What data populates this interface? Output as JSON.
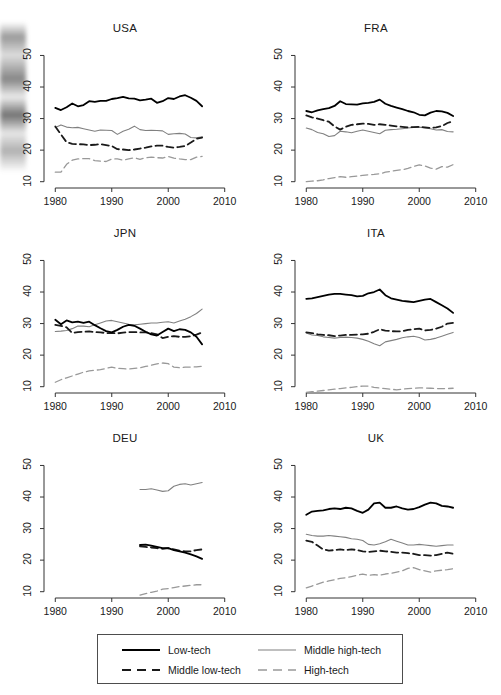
{
  "figure": {
    "background_color": "#ffffff",
    "panel_titles": [
      "USA",
      "FRA",
      "JPN",
      "ITA",
      "DEU",
      "UK"
    ]
  },
  "series_styles": {
    "low_tech": {
      "color": "#000000",
      "dash": "solid",
      "width": 1.8
    },
    "middle_low_tech": {
      "color": "#1a1a1a",
      "dash": "dashed",
      "width": 1.8
    },
    "middle_high_tech": {
      "color": "#808080",
      "dash": "solid",
      "width": 1.1
    },
    "high_tech": {
      "color": "#999999",
      "dash": "dashed",
      "width": 1.3
    }
  },
  "legend": {
    "position": "bottom-center",
    "entries": [
      {
        "label": "Low-tech",
        "key": "low_tech"
      },
      {
        "label": "Middle high-tech",
        "key": "middle_high_tech"
      },
      {
        "label": "Middle low-tech",
        "key": "middle_low_tech"
      },
      {
        "label": "High-tech",
        "key": "high_tech"
      }
    ]
  },
  "axes": {
    "xlim": [
      1978,
      2012
    ],
    "ylim": [
      8,
      53
    ],
    "xticks": [
      1980,
      1990,
      2000,
      2010
    ],
    "yticks": [
      10,
      20,
      30,
      40,
      50
    ],
    "xtick_labels": [
      "1980",
      "1990",
      "2000",
      "2010"
    ],
    "ytick_labels": [
      "10",
      "20",
      "30",
      "40",
      "50"
    ],
    "grid": false,
    "xlabel": "",
    "ylabel": ""
  },
  "chart_data": [
    {
      "type": "line",
      "title": "USA",
      "xlabel": "",
      "ylabel": "",
      "xlim": [
        1978,
        2012
      ],
      "ylim": [
        8,
        53
      ],
      "grid": false,
      "legend_position": "bottom-center",
      "x": [
        1980,
        1981,
        1982,
        1983,
        1984,
        1985,
        1986,
        1987,
        1988,
        1989,
        1990,
        1991,
        1992,
        1993,
        1994,
        1995,
        1996,
        1997,
        1998,
        1999,
        2000,
        2001,
        2002,
        2003,
        2004,
        2005,
        2006
      ],
      "series": [
        {
          "name": "Low-tech",
          "key": "low_tech",
          "values": [
            33.4,
            32.7,
            33.6,
            34.8,
            33.9,
            34.3,
            35.5,
            35.3,
            35.6,
            35.6,
            36.2,
            36.5,
            36.9,
            36.4,
            36.3,
            35.8,
            36.0,
            36.3,
            35.0,
            35.5,
            36.5,
            36.2,
            37.0,
            37.4,
            36.6,
            35.6,
            33.9
          ]
        },
        {
          "name": "Middle low-tech",
          "key": "middle_low_tech",
          "values": [
            27.5,
            25.0,
            22.5,
            22.0,
            21.9,
            21.8,
            21.6,
            21.7,
            21.9,
            21.6,
            21.3,
            20.3,
            20.2,
            20.0,
            20.2,
            20.5,
            20.8,
            21.2,
            21.4,
            21.4,
            21.0,
            20.8,
            21.0,
            21.3,
            22.4,
            23.6,
            24.0
          ]
        },
        {
          "name": "Middle high-tech",
          "key": "middle_high_tech",
          "values": [
            27.2,
            28.0,
            27.3,
            27.1,
            27.2,
            26.8,
            26.4,
            26.0,
            26.4,
            26.3,
            26.2,
            25.0,
            26.0,
            26.6,
            27.6,
            26.5,
            26.2,
            26.3,
            26.2,
            26.1,
            25.0,
            25.2,
            25.3,
            25.1,
            24.0,
            23.9,
            24.2
          ]
        },
        {
          "name": "High-tech",
          "key": "high_tech",
          "values": [
            13.0,
            13.0,
            15.5,
            16.8,
            17.2,
            17.3,
            17.3,
            16.7,
            16.5,
            16.4,
            17.2,
            17.2,
            16.8,
            17.2,
            17.6,
            17.1,
            17.6,
            17.8,
            17.6,
            17.5,
            18.0,
            17.5,
            17.2,
            17.0,
            17.0,
            17.8,
            18.0
          ]
        }
      ]
    },
    {
      "type": "line",
      "title": "FRA",
      "xlabel": "",
      "ylabel": "",
      "xlim": [
        1978,
        2012
      ],
      "ylim": [
        8,
        53
      ],
      "grid": false,
      "legend_position": "bottom-center",
      "x": [
        1980,
        1981,
        1982,
        1983,
        1984,
        1985,
        1986,
        1987,
        1988,
        1989,
        1990,
        1991,
        1992,
        1993,
        1994,
        1995,
        1996,
        1997,
        1998,
        1999,
        2000,
        2001,
        2002,
        2003,
        2004,
        2005,
        2006
      ],
      "series": [
        {
          "name": "Low-tech",
          "key": "low_tech",
          "values": [
            32.4,
            32.0,
            32.6,
            33.0,
            33.3,
            34.0,
            35.5,
            34.6,
            34.5,
            34.4,
            34.8,
            35.0,
            35.3,
            36.0,
            34.7,
            34.0,
            33.5,
            33.0,
            32.4,
            32.0,
            31.2,
            31.0,
            31.9,
            32.4,
            32.3,
            31.8,
            30.8
          ]
        },
        {
          "name": "Middle low-tech",
          "key": "middle_low_tech",
          "values": [
            31.0,
            30.4,
            30.0,
            29.5,
            29.0,
            27.5,
            26.5,
            27.4,
            28.0,
            28.2,
            28.4,
            28.3,
            28.0,
            28.2,
            28.0,
            27.8,
            27.5,
            27.4,
            27.2,
            27.3,
            27.4,
            27.2,
            27.0,
            27.2,
            27.6,
            28.6,
            29.2
          ]
        },
        {
          "name": "Middle high-tech",
          "key": "middle_high_tech",
          "values": [
            27.0,
            26.5,
            25.6,
            25.2,
            24.3,
            24.6,
            26.0,
            25.8,
            25.5,
            26.0,
            26.4,
            26.0,
            25.6,
            25.2,
            26.3,
            26.5,
            26.6,
            26.8,
            27.0,
            27.2,
            27.3,
            27.0,
            26.8,
            26.4,
            26.5,
            25.9,
            25.8
          ]
        },
        {
          "name": "High-tech",
          "key": "high_tech",
          "values": [
            10.0,
            10.2,
            10.3,
            10.6,
            11.0,
            11.3,
            11.6,
            11.4,
            11.6,
            11.8,
            12.0,
            12.2,
            12.3,
            12.5,
            13.0,
            13.3,
            13.6,
            13.8,
            14.2,
            14.8,
            15.3,
            15.0,
            14.3,
            14.0,
            14.8,
            14.6,
            15.4
          ]
        }
      ]
    },
    {
      "type": "line",
      "title": "JPN",
      "xlabel": "",
      "ylabel": "",
      "xlim": [
        1978,
        2012
      ],
      "ylim": [
        8,
        53
      ],
      "grid": false,
      "legend_position": "bottom-center",
      "x": [
        1980,
        1981,
        1982,
        1983,
        1984,
        1985,
        1986,
        1987,
        1988,
        1989,
        1990,
        1991,
        1992,
        1993,
        1994,
        1995,
        1996,
        1997,
        1998,
        1999,
        2000,
        2001,
        2002,
        2003,
        2004,
        2005,
        2006
      ],
      "series": [
        {
          "name": "Low-tech",
          "key": "low_tech",
          "values": [
            31.2,
            29.8,
            31.0,
            30.4,
            30.6,
            30.2,
            30.6,
            29.5,
            28.5,
            27.6,
            27.2,
            28.0,
            29.0,
            29.6,
            29.3,
            28.4,
            27.4,
            26.6,
            26.2,
            27.3,
            28.4,
            27.6,
            28.2,
            28.0,
            27.2,
            25.8,
            23.4
          ]
        },
        {
          "name": "Middle low-tech",
          "key": "middle_low_tech",
          "values": [
            29.6,
            29.3,
            28.8,
            27.0,
            27.3,
            27.4,
            27.5,
            27.3,
            27.2,
            27.0,
            27.0,
            26.9,
            27.1,
            27.3,
            27.3,
            27.2,
            27.2,
            27.0,
            26.6,
            25.4,
            25.8,
            26.0,
            25.8,
            25.8,
            26.0,
            26.5,
            27.2
          ]
        },
        {
          "name": "Middle high-tech",
          "key": "middle_high_tech",
          "values": [
            27.5,
            27.6,
            27.8,
            28.4,
            29.2,
            29.2,
            29.0,
            29.6,
            30.2,
            30.8,
            31.0,
            30.6,
            30.2,
            29.8,
            29.6,
            29.8,
            30.0,
            30.2,
            30.2,
            30.4,
            30.6,
            30.2,
            30.8,
            31.4,
            32.2,
            33.2,
            34.6
          ]
        },
        {
          "name": "High-tech",
          "key": "high_tech",
          "values": [
            11.4,
            12.2,
            12.8,
            13.4,
            14.0,
            14.6,
            15.0,
            15.2,
            15.4,
            15.8,
            16.2,
            15.8,
            15.7,
            15.6,
            15.8,
            16.0,
            16.4,
            16.8,
            17.2,
            17.5,
            17.3,
            16.2,
            16.0,
            16.2,
            16.2,
            16.3,
            16.5
          ]
        }
      ]
    },
    {
      "type": "line",
      "title": "ITA",
      "xlabel": "",
      "ylabel": "",
      "xlim": [
        1978,
        2012
      ],
      "ylim": [
        8,
        53
      ],
      "grid": false,
      "legend_position": "bottom-center",
      "x": [
        1980,
        1981,
        1982,
        1983,
        1984,
        1985,
        1986,
        1987,
        1988,
        1989,
        1990,
        1991,
        1992,
        1993,
        1994,
        1995,
        1996,
        1997,
        1998,
        1999,
        2000,
        2001,
        2002,
        2003,
        2004,
        2005,
        2006
      ],
      "series": [
        {
          "name": "Low-tech",
          "key": "low_tech",
          "values": [
            37.8,
            38.0,
            38.4,
            38.8,
            39.2,
            39.4,
            39.4,
            39.2,
            39.0,
            38.6,
            38.8,
            39.6,
            40.0,
            40.8,
            39.0,
            38.0,
            37.6,
            37.2,
            37.0,
            36.8,
            37.2,
            37.6,
            37.8,
            36.8,
            35.8,
            34.8,
            33.4
          ]
        },
        {
          "name": "Middle low-tech",
          "key": "middle_low_tech",
          "values": [
            27.2,
            27.0,
            26.6,
            26.4,
            26.3,
            26.0,
            26.2,
            26.4,
            26.4,
            26.5,
            26.6,
            26.8,
            27.4,
            28.2,
            27.8,
            27.6,
            27.5,
            27.6,
            28.0,
            28.2,
            28.4,
            27.8,
            28.0,
            28.4,
            29.0,
            30.0,
            30.2
          ]
        },
        {
          "name": "Middle high-tech",
          "key": "middle_high_tech",
          "values": [
            27.0,
            26.4,
            26.2,
            25.8,
            25.6,
            25.4,
            25.6,
            25.7,
            25.6,
            25.4,
            25.0,
            24.4,
            23.6,
            23.0,
            24.2,
            24.6,
            25.0,
            25.5,
            25.8,
            26.0,
            25.6,
            24.8,
            25.0,
            25.4,
            26.0,
            26.6,
            27.2
          ]
        },
        {
          "name": "High-tech",
          "key": "high_tech",
          "values": [
            8.2,
            8.4,
            8.6,
            8.8,
            9.0,
            9.2,
            9.4,
            9.6,
            9.8,
            10.0,
            10.2,
            10.2,
            9.8,
            9.6,
            9.4,
            9.2,
            9.0,
            9.2,
            9.4,
            9.5,
            9.6,
            9.6,
            9.5,
            9.4,
            9.4,
            9.4,
            9.5
          ]
        }
      ]
    },
    {
      "type": "line",
      "title": "DEU",
      "xlabel": "",
      "ylabel": "",
      "xlim": [
        1978,
        2012
      ],
      "ylim": [
        8,
        53
      ],
      "grid": false,
      "legend_position": "bottom-center",
      "x": [
        1995,
        1996,
        1997,
        1998,
        1999,
        2000,
        2001,
        2002,
        2003,
        2004,
        2005,
        2006
      ],
      "series": [
        {
          "name": "Low-tech",
          "key": "low_tech",
          "values": [
            24.8,
            24.9,
            24.6,
            24.2,
            23.8,
            23.8,
            23.2,
            22.8,
            22.4,
            21.8,
            21.2,
            20.4
          ]
        },
        {
          "name": "Middle low-tech",
          "key": "middle_low_tech",
          "values": [
            24.4,
            24.2,
            24.0,
            23.8,
            23.6,
            23.8,
            23.4,
            23.0,
            22.8,
            22.8,
            23.2,
            23.4
          ]
        },
        {
          "name": "Middle high-tech",
          "key": "middle_high_tech",
          "values": [
            42.4,
            42.4,
            42.6,
            42.2,
            41.8,
            42.0,
            43.4,
            44.0,
            44.2,
            43.8,
            44.2,
            44.6
          ]
        },
        {
          "name": "High-tech",
          "key": "high_tech",
          "values": [
            8.9,
            9.4,
            9.8,
            10.2,
            10.8,
            11.0,
            11.3,
            11.6,
            11.8,
            12.0,
            12.2,
            12.2
          ]
        }
      ]
    },
    {
      "type": "line",
      "title": "UK",
      "xlabel": "",
      "ylabel": "",
      "xlim": [
        1978,
        2012
      ],
      "ylim": [
        8,
        53
      ],
      "grid": false,
      "legend_position": "bottom-center",
      "x": [
        1980,
        1981,
        1982,
        1983,
        1984,
        1985,
        1986,
        1987,
        1988,
        1989,
        1990,
        1991,
        1992,
        1993,
        1994,
        1995,
        1996,
        1997,
        1998,
        1999,
        2000,
        2001,
        2002,
        2003,
        2004,
        2005,
        2006
      ],
      "series": [
        {
          "name": "Low-tech",
          "key": "low_tech",
          "values": [
            34.4,
            35.4,
            35.6,
            35.8,
            36.2,
            36.4,
            36.2,
            36.6,
            36.4,
            35.6,
            35.0,
            36.0,
            38.0,
            38.2,
            36.6,
            36.6,
            37.0,
            36.4,
            36.0,
            36.2,
            36.8,
            37.6,
            38.2,
            38.0,
            37.2,
            37.0,
            36.6
          ]
        },
        {
          "name": "Middle low-tech",
          "key": "middle_low_tech",
          "values": [
            26.2,
            25.8,
            24.6,
            23.4,
            23.0,
            23.2,
            23.4,
            23.2,
            23.4,
            23.2,
            22.8,
            22.6,
            22.8,
            23.0,
            22.8,
            22.6,
            22.4,
            22.4,
            22.2,
            22.0,
            21.6,
            21.6,
            21.4,
            21.6,
            22.0,
            22.4,
            22.0
          ]
        },
        {
          "name": "Middle high-tech",
          "key": "middle_high_tech",
          "values": [
            28.2,
            27.8,
            27.6,
            27.6,
            27.8,
            27.6,
            27.4,
            27.2,
            26.8,
            26.6,
            26.2,
            25.0,
            24.8,
            25.2,
            25.8,
            26.6,
            26.0,
            25.4,
            24.8,
            24.8,
            25.0,
            24.8,
            24.6,
            24.4,
            24.6,
            24.8,
            24.8
          ]
        },
        {
          "name": "High-tech",
          "key": "high_tech",
          "values": [
            11.2,
            11.8,
            12.4,
            13.0,
            13.4,
            13.8,
            14.2,
            14.4,
            14.8,
            15.2,
            15.6,
            15.2,
            15.4,
            15.2,
            15.6,
            15.8,
            16.2,
            16.6,
            17.4,
            17.6,
            17.0,
            16.6,
            16.2,
            16.6,
            16.8,
            17.0,
            17.3
          ]
        }
      ]
    }
  ]
}
